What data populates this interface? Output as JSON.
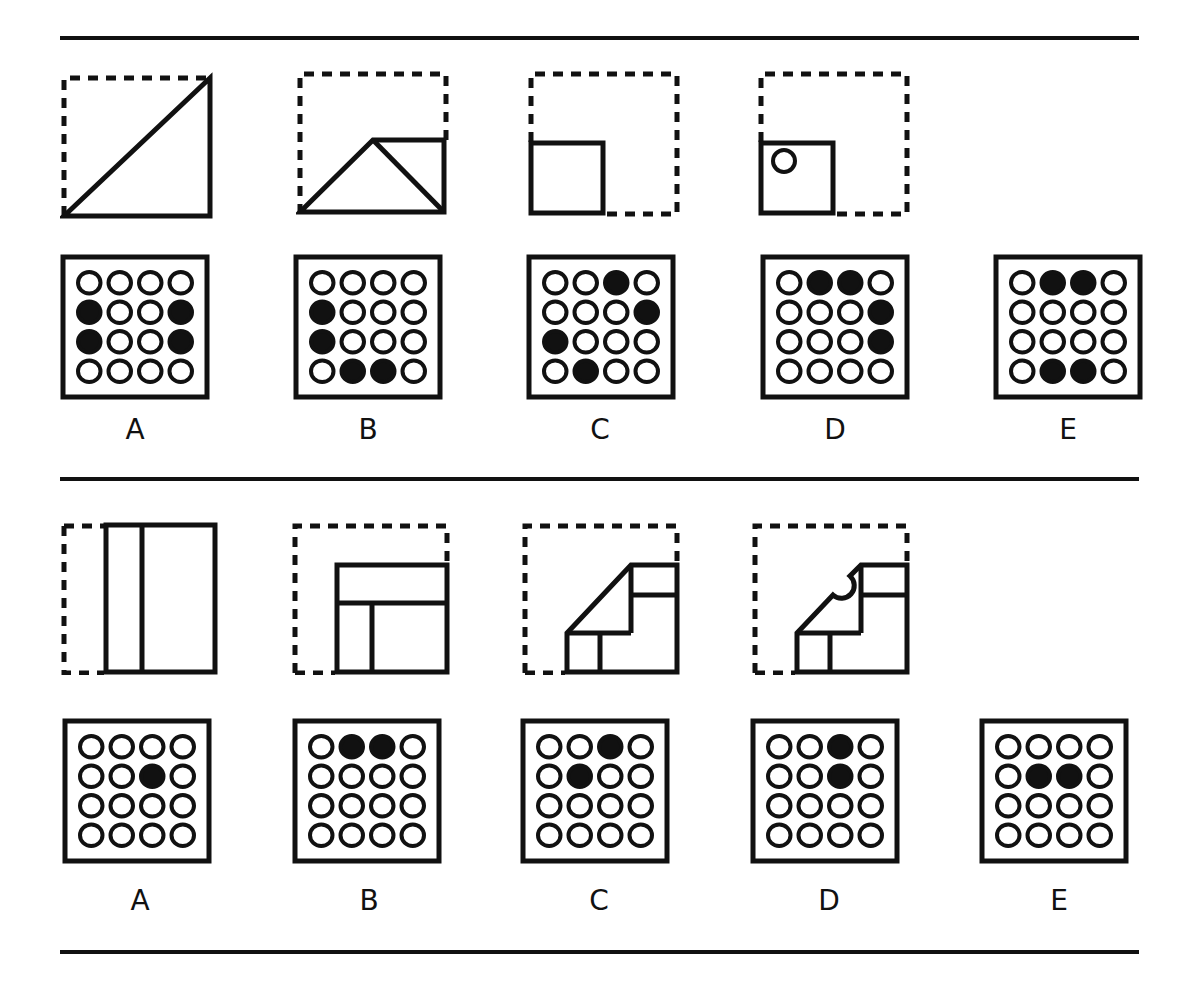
{
  "colors": {
    "ink": "#111111",
    "background": "#ffffff"
  },
  "problems": [
    {
      "id": 1,
      "fold_steps": [
        {
          "step": 1,
          "description": "square folded along diagonal, lower-right triangle remains"
        },
        {
          "step": 2,
          "description": "triangle folded again forming trapezoid with small square flap"
        },
        {
          "step": 3,
          "description": "folded to small square in lower-left corner"
        },
        {
          "step": 4,
          "description": "small square punched with one hole near top-left"
        }
      ],
      "options": [
        {
          "label": "A",
          "filled": [
            [
              1,
              0
            ],
            [
              1,
              3
            ],
            [
              2,
              0
            ],
            [
              2,
              3
            ]
          ]
        },
        {
          "label": "B",
          "filled": [
            [
              1,
              0
            ],
            [
              2,
              0
            ],
            [
              3,
              1
            ],
            [
              3,
              2
            ]
          ]
        },
        {
          "label": "C",
          "filled": [
            [
              0,
              2
            ],
            [
              1,
              3
            ],
            [
              2,
              0
            ],
            [
              3,
              1
            ]
          ]
        },
        {
          "label": "D",
          "filled": [
            [
              0,
              1
            ],
            [
              0,
              2
            ],
            [
              1,
              3
            ],
            [
              2,
              3
            ]
          ]
        },
        {
          "label": "E",
          "filled": [
            [
              0,
              1
            ],
            [
              0,
              2
            ],
            [
              3,
              1
            ],
            [
              3,
              2
            ]
          ]
        }
      ]
    },
    {
      "id": 2,
      "fold_steps": [
        {
          "step": 1,
          "description": "left strip folded over to the right"
        },
        {
          "step": 2,
          "description": "top folded down forming rectangle in lower-right"
        },
        {
          "step": 3,
          "description": "corner folded diagonally"
        },
        {
          "step": 4,
          "description": "semicircular notch cut on diagonal edge"
        }
      ],
      "options": [
        {
          "label": "A",
          "filled": [
            [
              1,
              2
            ]
          ]
        },
        {
          "label": "B",
          "filled": [
            [
              0,
              1
            ],
            [
              0,
              2
            ]
          ]
        },
        {
          "label": "C",
          "filled": [
            [
              0,
              2
            ],
            [
              1,
              1
            ]
          ]
        },
        {
          "label": "D",
          "filled": [
            [
              0,
              2
            ],
            [
              1,
              2
            ]
          ]
        },
        {
          "label": "E",
          "filled": [
            [
              1,
              1
            ],
            [
              1,
              2
            ]
          ]
        }
      ]
    }
  ]
}
